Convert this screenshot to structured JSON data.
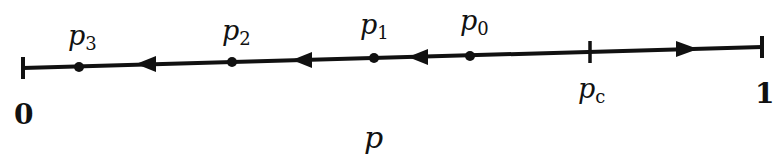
{
  "diagram": {
    "type": "one-dimensional flow / iteration diagram",
    "axis_variable": "p",
    "endpoints": [
      {
        "label": "0",
        "x": 23,
        "y": 68
      },
      {
        "label": "1",
        "x": 762,
        "y": 47
      }
    ],
    "critical_point": {
      "label": "p",
      "subscript": "c",
      "x": 590,
      "y": 52
    },
    "points": [
      {
        "label": "p",
        "subscript": "0",
        "x": 470,
        "y": 56
      },
      {
        "label": "p",
        "subscript": "1",
        "x": 374,
        "y": 58
      },
      {
        "label": "p",
        "subscript": "2",
        "x": 232,
        "y": 62
      },
      {
        "label": "p",
        "subscript": "3",
        "x": 79,
        "y": 67
      }
    ],
    "arrows": [
      {
        "direction": "left",
        "x": 148,
        "y": 64
      },
      {
        "direction": "left",
        "x": 300,
        "y": 60
      },
      {
        "direction": "left",
        "x": 415,
        "y": 57
      },
      {
        "direction": "right",
        "x": 688,
        "y": 49
      }
    ],
    "colors": {
      "ink": "#111111",
      "background": "#ffffff"
    }
  }
}
